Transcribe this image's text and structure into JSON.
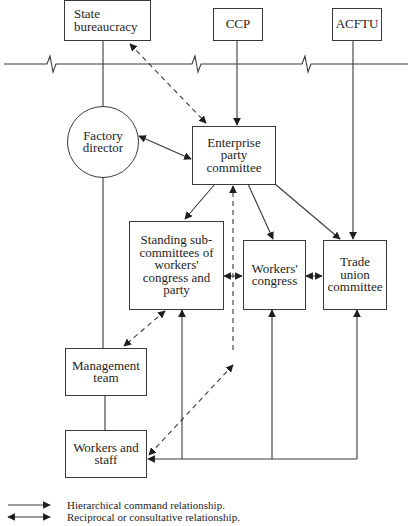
{
  "diagram": {
    "type": "organizational-relationship-diagram",
    "nodes": {
      "state_bureaucracy": "State bureaucracy",
      "ccp": "CCP",
      "acftu": "ACFTU",
      "factory_director": "Factory director",
      "enterprise_party_committee": "Enterprise party committee",
      "standing_subcommittees": "Standing sub-committees of workers' congress and party",
      "workers_congress": "Workers' congress",
      "trade_union_committee": "Trade union committee",
      "management_team": "Management team",
      "workers_and_staff": "Workers and staff"
    },
    "node_lines": {
      "state_bureaucracy": [
        "State",
        "bureaucracy"
      ],
      "factory_director": [
        "Factory",
        "director"
      ],
      "enterprise_party_committee": [
        "Enterprise",
        "party",
        "committee"
      ],
      "standing_subcommittees": [
        "Standing sub-",
        "committees of",
        "workers'",
        "congress and",
        "party"
      ],
      "workers_congress": [
        "Workers'",
        "congress"
      ],
      "trade_union_committee": [
        "Trade",
        "union",
        "committee"
      ],
      "management_team": [
        "Management",
        "team"
      ],
      "workers_and_staff": [
        "Workers and",
        "staff"
      ]
    },
    "edges": [
      {
        "from": "CCP",
        "to": "Enterprise party committee",
        "type": "hierarchical"
      },
      {
        "from": "ACFTU",
        "to": "Trade union committee",
        "type": "hierarchical"
      },
      {
        "from": "State bureaucracy",
        "to": "Enterprise party committee",
        "type": "reciprocal-dashed"
      },
      {
        "from": "State bureaucracy",
        "to": "Factory director",
        "type": "line"
      },
      {
        "from": "Factory director",
        "to": "Enterprise party committee",
        "type": "reciprocal"
      },
      {
        "from": "Enterprise party committee",
        "to": "Standing sub-committees of workers' congress and party",
        "type": "hierarchical"
      },
      {
        "from": "Enterprise party committee",
        "to": "Workers' congress",
        "type": "hierarchical"
      },
      {
        "from": "Enterprise party committee",
        "to": "Trade union committee",
        "type": "hierarchical"
      },
      {
        "from": "Standing sub-committees of workers' congress and party",
        "to": "Workers' congress",
        "type": "reciprocal"
      },
      {
        "from": "Workers' congress",
        "to": "Trade union committee",
        "type": "reciprocal"
      },
      {
        "from": "Standing sub-committees of workers' congress and party",
        "to": "Management team",
        "type": "reciprocal-dashed"
      },
      {
        "from": "Workers and staff",
        "to": "Enterprise party committee",
        "type": "reciprocal-dashed"
      },
      {
        "from": "Factory director",
        "to": "Management team",
        "type": "line"
      },
      {
        "from": "Management team",
        "to": "Workers and staff",
        "type": "line"
      },
      {
        "from": "Workers and staff",
        "to": "Standing sub-committees of workers' congress and party",
        "type": "hierarchical"
      },
      {
        "from": "Workers and staff",
        "to": "Workers' congress",
        "type": "hierarchical"
      },
      {
        "from": "Workers and staff",
        "to": "Trade union committee",
        "type": "hierarchical"
      }
    ]
  },
  "legend": {
    "hierarchical": "Hierarchical command relationship.",
    "reciprocal": "Reciprocal or consultative relationship."
  },
  "colors": {
    "line": "#3a3a3a",
    "arrow": "#1e1e1e",
    "background": "#ffffff"
  }
}
